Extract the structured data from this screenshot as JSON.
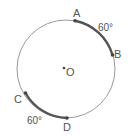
{
  "diagram": {
    "center": {
      "label": "O"
    },
    "points": [
      {
        "label": "A"
      },
      {
        "label": "B"
      },
      {
        "label": "C"
      },
      {
        "label": "D"
      }
    ],
    "arcs": [
      {
        "from": "A",
        "to": "B",
        "label": "60°"
      },
      {
        "from": "C",
        "to": "D",
        "label": "60°"
      }
    ],
    "colors": {
      "circle": "#888888",
      "arc": "#555555",
      "text": "#555555"
    }
  }
}
